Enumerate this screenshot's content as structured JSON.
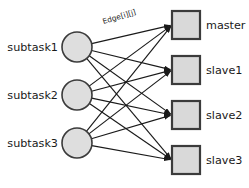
{
  "diagram": {
    "type": "bipartite-graph",
    "background_color": "#ffffff",
    "node_fill_color": "#dedede",
    "node_stroke_color": "#3b3b3b",
    "edge_color": "#1a1a1a",
    "left_nodes": [
      {
        "id": "subtask1",
        "label": "subtask1",
        "shape": "circle",
        "cx": 77,
        "cy": 47,
        "r": 15
      },
      {
        "id": "subtask2",
        "label": "subtask2",
        "shape": "circle",
        "cx": 77,
        "cy": 95,
        "r": 15
      },
      {
        "id": "subtask3",
        "label": "subtask3",
        "shape": "circle",
        "cx": 77,
        "cy": 143,
        "r": 15
      }
    ],
    "right_nodes": [
      {
        "id": "master",
        "label": "master",
        "shape": "square",
        "x": 172,
        "y": 11,
        "size": 28
      },
      {
        "id": "slave1",
        "label": "slave1",
        "shape": "square",
        "x": 172,
        "y": 56,
        "size": 28
      },
      {
        "id": "slave2",
        "label": "slave2",
        "shape": "square",
        "x": 172,
        "y": 101,
        "size": 28
      },
      {
        "id": "slave3",
        "label": "slave3",
        "shape": "square",
        "x": 172,
        "y": 146,
        "size": 28
      }
    ],
    "edge_label": {
      "text": "Edge[i][j]",
      "x": 120,
      "y": 19,
      "rotation": -17
    },
    "edges": [
      {
        "from": "subtask1",
        "to": "master"
      },
      {
        "from": "subtask1",
        "to": "slave1"
      },
      {
        "from": "subtask1",
        "to": "slave2"
      },
      {
        "from": "subtask1",
        "to": "slave3"
      },
      {
        "from": "subtask2",
        "to": "master"
      },
      {
        "from": "subtask2",
        "to": "slave1"
      },
      {
        "from": "subtask2",
        "to": "slave2"
      },
      {
        "from": "subtask2",
        "to": "slave3"
      },
      {
        "from": "subtask3",
        "to": "master"
      },
      {
        "from": "subtask3",
        "to": "slave1"
      },
      {
        "from": "subtask3",
        "to": "slave2"
      },
      {
        "from": "subtask3",
        "to": "slave3"
      }
    ]
  }
}
